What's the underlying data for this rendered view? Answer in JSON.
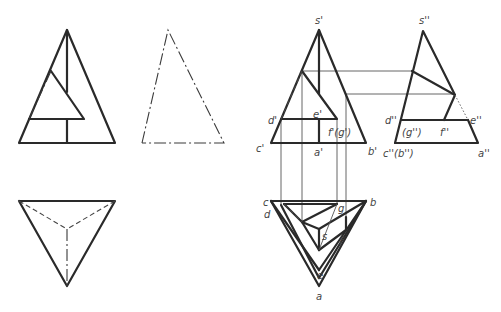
{
  "figure": {
    "left_front_view": {
      "thick": [
        [
          [
            19,
            143
          ],
          [
            67,
            30
          ],
          [
            115,
            143
          ],
          [
            19,
            143
          ]
        ],
        [
          [
            67,
            30
          ],
          [
            67,
            92
          ]
        ],
        [
          [
            51,
            71
          ],
          [
            84,
            119
          ],
          [
            29,
            119
          ]
        ],
        [
          [
            67,
            119
          ],
          [
            67,
            143
          ]
        ]
      ],
      "dashdot": [
        [
          [
            51,
            71
          ],
          [
            29,
            119
          ]
        ]
      ]
    },
    "left_side_view": {
      "dashdot": [
        [
          [
            142,
            143
          ],
          [
            168,
            30
          ],
          [
            224,
            143
          ],
          [
            142,
            143
          ]
        ]
      ]
    },
    "left_plan_view": {
      "thick": [
        [
          [
            19,
            201
          ],
          [
            115,
            201
          ],
          [
            67,
            286
          ],
          [
            19,
            201
          ]
        ]
      ],
      "dashed": [
        [
          [
            19,
            201
          ],
          [
            67,
            229
          ]
        ],
        [
          [
            115,
            201
          ],
          [
            67,
            229
          ]
        ]
      ],
      "dashdot": [
        [
          [
            67,
            229
          ],
          [
            67,
            286
          ]
        ]
      ]
    },
    "right_front_view": {
      "thick": [
        [
          [
            271,
            143
          ],
          [
            319,
            30
          ],
          [
            366,
            143
          ],
          [
            271,
            143
          ]
        ],
        [
          [
            319,
            30
          ],
          [
            319,
            94
          ]
        ],
        [
          [
            302,
            71
          ],
          [
            337,
            119
          ],
          [
            281,
            119
          ]
        ],
        [
          [
            319,
            119
          ],
          [
            319,
            143
          ]
        ]
      ],
      "dashed": [
        [
          [
            302,
            71
          ],
          [
            281,
            119
          ]
        ]
      ]
    },
    "right_side_view": {
      "thick": [
        [
          [
            395,
            143
          ],
          [
            423,
            31
          ],
          [
            455,
            95
          ]
        ],
        [
          [
            395,
            143
          ],
          [
            478,
            143
          ],
          [
            468,
            120
          ]
        ],
        [
          [
            412,
            71
          ],
          [
            455,
            95
          ],
          [
            444,
            120
          ]
        ],
        [
          [
            401,
            120
          ],
          [
            468,
            120
          ]
        ]
      ],
      "dotted": [
        [
          [
            455,
            95
          ],
          [
            468,
            120
          ]
        ]
      ]
    },
    "right_plan_view": {
      "thick": [
        [
          [
            271,
            201
          ],
          [
            366,
            201
          ],
          [
            319,
            286
          ],
          [
            271,
            201
          ]
        ],
        [
          [
            271,
            201
          ],
          [
            319,
            270
          ]
        ],
        [
          [
            366,
            201
          ],
          [
            319,
            270
          ]
        ],
        [
          [
            284,
            204
          ],
          [
            337,
            204
          ]
        ],
        [
          [
            284,
            204
          ],
          [
            302,
            222
          ]
        ],
        [
          [
            302,
            222
          ],
          [
            337,
            204
          ]
        ],
        [
          [
            302,
            222
          ],
          [
            319,
            229
          ]
        ],
        [
          [
            319,
            229
          ],
          [
            366,
            201
          ]
        ],
        [
          [
            319,
            229
          ],
          [
            319,
            250
          ]
        ],
        [
          [
            302,
            222
          ],
          [
            319,
            250
          ]
        ],
        [
          [
            319,
            250
          ],
          [
            346,
            230
          ]
        ],
        [
          [
            346,
            230
          ],
          [
            346,
            217
          ]
        ],
        [
          [
            281,
            205
          ],
          [
            319,
            278
          ]
        ],
        [
          [
            366,
            201
          ],
          [
            319,
            278
          ]
        ]
      ],
      "dashed": [
        [
          [
            284,
            204
          ],
          [
            302,
            222
          ]
        ]
      ],
      "thin": [
        [
          [
            319,
            250
          ],
          [
            337,
            204
          ]
        ]
      ]
    },
    "projection_lines": {
      "vertical": [
        [
          [
            281,
            119
          ],
          [
            281,
            204
          ]
        ],
        [
          [
            302,
            71
          ],
          [
            302,
            222
          ]
        ],
        [
          [
            337,
            119
          ],
          [
            337,
            204
          ]
        ],
        [
          [
            346,
            94
          ],
          [
            346,
            230
          ]
        ]
      ],
      "horizontal": [
        [
          [
            302,
            71
          ],
          [
            412,
            71
          ]
        ],
        [
          [
            346,
            94
          ],
          [
            455,
            94
          ]
        ]
      ]
    },
    "labels": [
      {
        "id": "s-prime",
        "text": "s'",
        "x": 315,
        "y": 24
      },
      {
        "id": "d-prime",
        "text": "d'",
        "x": 268,
        "y": 124
      },
      {
        "id": "e-prime",
        "text": "e'",
        "x": 313,
        "y": 118
      },
      {
        "id": "fg-prime",
        "text": "f'(g')",
        "x": 328,
        "y": 136
      },
      {
        "id": "c-prime",
        "text": "c'",
        "x": 256,
        "y": 152
      },
      {
        "id": "a-prime",
        "text": "a'",
        "x": 314,
        "y": 156
      },
      {
        "id": "b-prime",
        "text": "b'",
        "x": 368,
        "y": 155
      },
      {
        "id": "s-dprime",
        "text": "s''",
        "x": 419,
        "y": 24
      },
      {
        "id": "d-dprime",
        "text": "d''",
        "x": 385,
        "y": 124
      },
      {
        "id": "e-dprime",
        "text": "e''",
        "x": 470,
        "y": 124
      },
      {
        "id": "g-dprime",
        "text": "(g'')",
        "x": 402,
        "y": 136
      },
      {
        "id": "f-dprime",
        "text": "f''",
        "x": 440,
        "y": 136
      },
      {
        "id": "cb-dprime",
        "text": "c''(b'')",
        "x": 383,
        "y": 157
      },
      {
        "id": "a-dprime",
        "text": "a''",
        "x": 478,
        "y": 157
      },
      {
        "id": "c",
        "text": "c",
        "x": 263,
        "y": 206
      },
      {
        "id": "d",
        "text": "d",
        "x": 264,
        "y": 218
      },
      {
        "id": "b",
        "text": "b",
        "x": 370,
        "y": 206
      },
      {
        "id": "g",
        "text": "g",
        "x": 338,
        "y": 212
      },
      {
        "id": "s",
        "text": "s",
        "x": 322,
        "y": 240
      },
      {
        "id": "f",
        "text": "f",
        "x": 339,
        "y": 245
      },
      {
        "id": "e",
        "text": "e",
        "x": 317,
        "y": 279
      },
      {
        "id": "a",
        "text": "a",
        "x": 316,
        "y": 300
      }
    ]
  }
}
